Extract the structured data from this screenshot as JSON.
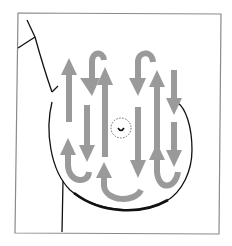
{
  "diagram": {
    "title": "Breast self-exam vertical strip pattern",
    "colors": {
      "background": "#ffffff",
      "frame": "#8a8a8a",
      "outline": "#111111",
      "arrow": "#9a9a9a",
      "nipple": "#333333"
    },
    "elements": [
      {
        "type": "frame",
        "label": "diagram-frame"
      },
      {
        "type": "body-outline",
        "label": "torso-outline"
      },
      {
        "type": "breast-outline",
        "label": "breast-circle"
      },
      {
        "type": "nipple",
        "label": "nipple-areola"
      },
      {
        "type": "arrow-set",
        "label": "vertical-strip-arrows",
        "count": 12,
        "pattern": "up-down serpentine"
      }
    ]
  }
}
